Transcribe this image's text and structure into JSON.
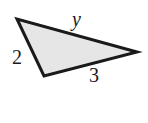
{
  "diagram": {
    "type": "triangle",
    "fill_color": "#e6e6e6",
    "stroke_color": "#1a1a1a",
    "vertices": [
      [
        17,
        19
      ],
      [
        44,
        76
      ],
      [
        137,
        52
      ]
    ],
    "sides": [
      {
        "label": "y",
        "between": "top-left and right",
        "italic": true
      },
      {
        "label": "2",
        "between": "top-left and bottom"
      },
      {
        "label": "3",
        "between": "bottom and right"
      }
    ]
  }
}
